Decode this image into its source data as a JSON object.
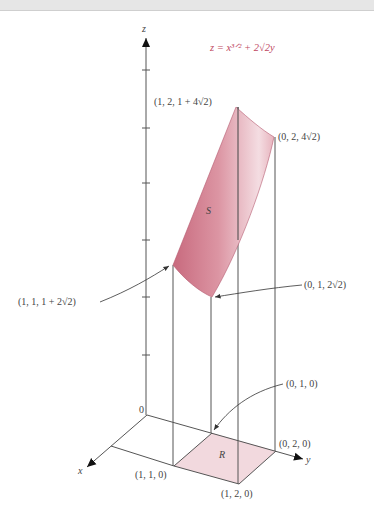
{
  "figure": {
    "equation": "z = x^{3/2} + 2√2y",
    "equation_display": "z = x³ᐟ² + 2√2y",
    "surface_label": "S",
    "region_label": "R",
    "axes": {
      "x": "x",
      "y": "y",
      "z": "z",
      "origin": "0"
    },
    "points": {
      "p_top_back": "(1, 2, 1 + 4√2)",
      "p_top_right": "(0, 2, 4√2)",
      "p_left_low": "(1, 1, 1 + 2√2)",
      "p_mid_low": "(0, 1, 2√2)",
      "p_010": "(0, 1, 0)",
      "p_020": "(0, 2, 0)",
      "p_110": "(1, 1, 0)",
      "p_120": "(1, 2, 0)"
    },
    "z_axis_ticks": 6,
    "colors": {
      "surface": "#d98a9a",
      "region": "#f2d9de",
      "equation": "#c0485f",
      "lines": "#555555"
    }
  }
}
